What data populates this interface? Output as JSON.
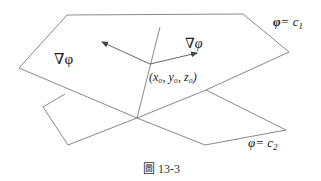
{
  "figure": {
    "caption_prefix": "圖",
    "caption_number": "13-3"
  },
  "labels": {
    "grad_phi": "∇φ",
    "grad_varphi": "∇φ",
    "point": "(x₀, y₀, z₀)",
    "surface1": "φ = c₁",
    "surface1_symbol": "φ",
    "surface1_eq": "= c",
    "surface1_sub": "1",
    "surface2_symbol": "φ",
    "surface2_eq": "= c",
    "surface2_sub": "2"
  },
  "elements": {
    "surface_1": "level surface phi = c1",
    "surface_2": "level surface varphi = c2",
    "intersection_point": "(x0, y0, z0)"
  },
  "colors": {
    "line": "#7a7a7a",
    "text": "#222222"
  }
}
